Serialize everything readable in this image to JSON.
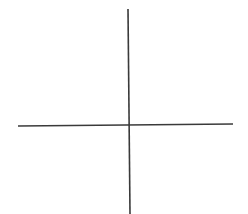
{
  "diagram": {
    "type": "cross-axes",
    "background": "#ffffff",
    "stroke_color": "#3a3a3a",
    "stroke_width": 1.6,
    "vertical_axis": {
      "x1": 128,
      "y1": 9,
      "x2": 130,
      "y2": 214
    },
    "horizontal_axis": {
      "x1": 18,
      "y1": 126,
      "x2": 233,
      "y2": 124
    },
    "intersection": {
      "x": 129,
      "y": 125
    }
  }
}
